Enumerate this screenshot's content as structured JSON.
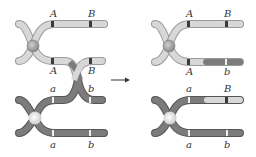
{
  "figure": {
    "topic": "crossing over between homologous chromosomes",
    "colors": {
      "light_chromatid": "#d8d8d8",
      "light_chromatid_edge": "#9a9a9a",
      "dark_chromatid": "#7c7c7c",
      "dark_chromatid_edge": "#555555",
      "dark_band": "#3a3a3a",
      "light_band": "#f0f0f0",
      "centromere_top": "#a8a8a8",
      "centromere_bottom": "#f4f4f4",
      "arrow": "#333333"
    },
    "before": {
      "top_labels": [
        "A",
        "B"
      ],
      "mid_top_labels": [
        "A",
        "B"
      ],
      "mid_bottom_labels": [
        "a",
        "b"
      ],
      "bottom_labels": [
        "a",
        "b"
      ]
    },
    "arrow_label": "",
    "after": {
      "top_labels": [
        "A",
        "B"
      ],
      "mid_top_labels": [
        "A",
        "b"
      ],
      "mid_bottom_labels": [
        "a",
        "B"
      ],
      "bottom_labels": [
        "a",
        "b"
      ]
    }
  }
}
